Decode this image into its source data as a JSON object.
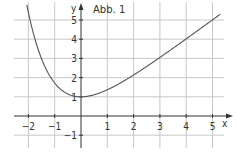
{
  "chart_data": {
    "type": "line",
    "title": "Abb. 1",
    "xlabel": "x",
    "ylabel": "y",
    "xlim": [
      -2.5,
      5.5
    ],
    "ylim": [
      -1.6,
      6.0
    ],
    "grid": true,
    "x_ticks": [
      -2,
      -1,
      1,
      2,
      3,
      4,
      5
    ],
    "y_ticks": [
      -1,
      1,
      2,
      3,
      4,
      5
    ],
    "series": [
      {
        "name": "f(x) = x + e^(-x)",
        "x": [
          -2.06,
          -1.75,
          -1.5,
          -1.25,
          -1,
          -0.75,
          -0.5,
          -0.25,
          0,
          0.5,
          1,
          1.5,
          2,
          2.5,
          3,
          3.5,
          4,
          4.5,
          5,
          5.3
        ],
        "y": [
          5.78,
          4.0,
          2.98,
          2.24,
          1.72,
          1.37,
          1.15,
          1.03,
          1.0,
          1.11,
          1.37,
          1.72,
          2.14,
          2.58,
          3.05,
          3.53,
          4.02,
          4.51,
          5.01,
          5.3
        ]
      }
    ],
    "colors": {
      "grid": "#c8c8c8",
      "axis": "#333333",
      "curve": "#555555"
    }
  },
  "labels": {
    "title": "Abb. 1",
    "x_axis": "x",
    "y_axis": "y"
  }
}
